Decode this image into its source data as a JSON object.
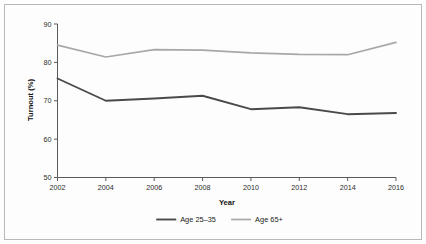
{
  "chart_data": {
    "type": "line",
    "title": "",
    "xlabel": "Year",
    "ylabel": "Turnout (%)",
    "x": [
      2002,
      2004,
      2006,
      2008,
      2010,
      2012,
      2014,
      2016
    ],
    "xtick_labels": [
      "2002",
      "2004",
      "2006",
      "2008",
      "2010",
      "2012",
      "2014",
      "2016"
    ],
    "ytick_labels": [
      "50",
      "60",
      "70",
      "80",
      "90"
    ],
    "yticks": [
      50,
      60,
      70,
      80,
      90
    ],
    "xlim": [
      2002,
      2016
    ],
    "ylim": [
      50,
      90
    ],
    "grid": false,
    "legend_position": "bottom-center",
    "series": [
      {
        "name": "Age 25–35",
        "color": "#4a4a4a",
        "values": [
          75.8,
          70.0,
          70.6,
          71.3,
          67.8,
          68.3,
          66.5,
          66.8
        ]
      },
      {
        "name": "Age 65+",
        "color": "#a8a8a8",
        "values": [
          84.5,
          81.4,
          83.3,
          83.2,
          82.5,
          82.1,
          82.0,
          85.2
        ]
      }
    ]
  },
  "legend": {
    "entries": [
      {
        "label": "Age 25–35",
        "color": "#4a4a4a"
      },
      {
        "label": "Age 65+",
        "color": "#a8a8a8"
      }
    ]
  },
  "axes": {
    "x_title": "Year",
    "y_title": "Turnout (%)"
  },
  "colors": {
    "axis": "#5a5a5a",
    "border": "#b9b9b9",
    "text": "#202020",
    "background": "#fdfdfd",
    "series_young": "#4a4a4a",
    "series_old": "#a8a8a8"
  }
}
